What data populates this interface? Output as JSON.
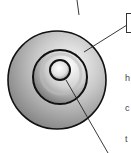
{
  "diagram": {
    "type": "concentric-layers",
    "layers": [
      {
        "name": "outer-layer",
        "cx": 57,
        "cy": 80,
        "r": 50
      },
      {
        "name": "middle-layer",
        "cx": 60,
        "cy": 77,
        "r": 27
      },
      {
        "name": "inner-core",
        "cx": 60,
        "cy": 70,
        "r": 10
      }
    ],
    "callouts": [
      {
        "name": "outer-callout",
        "x1": 79,
        "y1": 15,
        "x2": 77,
        "y2": 0
      },
      {
        "name": "middle-callout",
        "x1": 84,
        "y1": 52,
        "x2": 127,
        "y2": 25
      },
      {
        "name": "inner-callout",
        "x1": 66,
        "y1": 80,
        "x2": 108,
        "y2": 153
      }
    ],
    "colors": {
      "stroke": "#111111",
      "fill_light": "#f4f4f4",
      "fill_dark": "#7a7a7a"
    }
  },
  "side_text": {
    "lines": [
      "h",
      "c",
      "t",
      "s",
      "i",
      "r",
      "t"
    ],
    "bold_lines": [
      "c",
      "c"
    ]
  }
}
